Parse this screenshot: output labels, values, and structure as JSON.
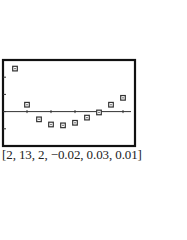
{
  "chart_data": {
    "type": "scatter",
    "title": "",
    "xlabel": "",
    "ylabel": "",
    "window": {
      "xmin": 2,
      "xmax": 13,
      "xscl": 2,
      "ymin": -0.02,
      "ymax": 0.03,
      "yscl": 0.01
    },
    "xlim": [
      2,
      13
    ],
    "ylim": [
      -0.02,
      0.03
    ],
    "grid": false,
    "legend": null,
    "marker": "square",
    "x": [
      3,
      4,
      5,
      6,
      7,
      8,
      9,
      10,
      11,
      12
    ],
    "y": [
      0.025,
      0.004,
      -0.0045,
      -0.0075,
      -0.008,
      -0.0065,
      -0.0035,
      -0.0005,
      0.004,
      0.008
    ]
  },
  "caption": "[2, 13, 2, −0.02, 0.03, 0.01]",
  "frame": {
    "left": 3,
    "top": 60,
    "right": 135,
    "bottom": 146
  },
  "colors": {
    "frame": "#111111",
    "axis": "#333333",
    "marker": "#333333",
    "background": "#ffffff"
  }
}
